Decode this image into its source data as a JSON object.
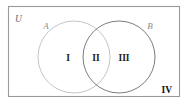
{
  "figure": {
    "type": "venn-diagram",
    "background_color": "#ffffff"
  },
  "universe": {
    "label": "U",
    "border_color": "#9a9a9a",
    "x": 8,
    "y": 6,
    "width": 172,
    "height": 91
  },
  "sets": [
    {
      "name": "set-a",
      "label": "A",
      "stroke_color": "#bdbdbd",
      "cx": 74,
      "cy": 57,
      "r": 36
    },
    {
      "name": "set-b",
      "label": "B",
      "stroke_color": "#6e6e6e",
      "cx": 119,
      "cy": 57,
      "r": 36
    }
  ],
  "regions": [
    {
      "name": "region-one",
      "label": "I",
      "meaning": "A only",
      "x": 68,
      "y": 58
    },
    {
      "name": "region-two",
      "label": "II",
      "meaning": "A intersect B",
      "x": 96,
      "y": 58
    },
    {
      "name": "region-three",
      "label": "III",
      "meaning": "B only",
      "x": 124,
      "y": 58
    },
    {
      "name": "region-four",
      "label": "IV",
      "meaning": "outside both sets",
      "x": 168,
      "y": 92
    }
  ],
  "colors": {
    "rectangle_border": "#9a9a9a",
    "circle_a_stroke": "#bdbdbd",
    "circle_b_stroke": "#6e6e6e",
    "label_text": "#1a1a1a",
    "set_label_text": "#8c8c8c"
  }
}
